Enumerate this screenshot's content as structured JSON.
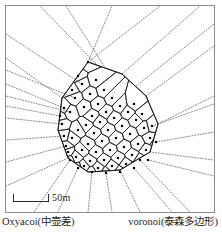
{
  "figure": {
    "scale_bar": {
      "label": "50m",
      "length_m": 50
    },
    "captions": {
      "left": "Oxyacoi(中壶差)",
      "right": "voronoi(泰森多边形)"
    },
    "colors": {
      "frame": "#8d8d8d",
      "cell_edge": "#1a1a1a",
      "ray": "#555555",
      "seed": "#000000",
      "background": "#ffffff"
    }
  },
  "chart_data": {
    "type": "scatter",
    "title": "",
    "subtitle": "",
    "xlabel": "",
    "ylabel": "",
    "grid": false,
    "legend_position": "none",
    "annotations": [
      "50m",
      "Oxyacoi(中壶差)",
      "voronoi(泰森多边形)"
    ],
    "xlim": [
      0,
      222
    ],
    "ylim": [
      0,
      232
    ],
    "point_count": 64,
    "hull": [
      [
        88,
        62
      ],
      [
        122,
        74
      ],
      [
        146,
        96
      ],
      [
        158,
        124
      ],
      [
        150,
        152
      ],
      [
        120,
        170
      ],
      [
        88,
        172
      ],
      [
        68,
        158
      ],
      [
        58,
        130
      ],
      [
        62,
        98
      ]
    ],
    "points": [
      [
        88,
        62
      ],
      [
        96,
        80
      ],
      [
        82,
        84
      ],
      [
        104,
        90
      ],
      [
        90,
        94
      ],
      [
        75,
        98
      ],
      [
        112,
        98
      ],
      [
        98,
        104
      ],
      [
        84,
        107
      ],
      [
        120,
        106
      ],
      [
        106,
        112
      ],
      [
        92,
        116
      ],
      [
        70,
        112
      ],
      [
        128,
        112
      ],
      [
        114,
        118
      ],
      [
        100,
        122
      ],
      [
        86,
        125
      ],
      [
        136,
        120
      ],
      [
        122,
        126
      ],
      [
        108,
        130
      ],
      [
        94,
        133
      ],
      [
        78,
        130
      ],
      [
        144,
        128
      ],
      [
        130,
        134
      ],
      [
        116,
        138
      ],
      [
        102,
        141
      ],
      [
        88,
        144
      ],
      [
        72,
        138
      ],
      [
        150,
        138
      ],
      [
        138,
        144
      ],
      [
        124,
        147
      ],
      [
        110,
        150
      ],
      [
        96,
        152
      ],
      [
        82,
        150
      ],
      [
        66,
        146
      ],
      [
        146,
        150
      ],
      [
        132,
        155
      ],
      [
        118,
        158
      ],
      [
        104,
        160
      ],
      [
        90,
        161
      ],
      [
        76,
        157
      ],
      [
        140,
        160
      ],
      [
        126,
        164
      ],
      [
        112,
        166
      ],
      [
        98,
        168
      ],
      [
        84,
        166
      ],
      [
        68,
        152
      ],
      [
        62,
        124
      ],
      [
        64,
        108
      ],
      [
        72,
        90
      ],
      [
        134,
        104
      ],
      [
        142,
        114
      ],
      [
        152,
        126
      ],
      [
        156,
        142
      ],
      [
        148,
        160
      ],
      [
        134,
        168
      ],
      [
        120,
        172
      ],
      [
        106,
        173
      ],
      [
        92,
        172
      ],
      [
        78,
        168
      ],
      [
        70,
        160
      ],
      [
        64,
        136
      ],
      [
        60,
        116
      ],
      [
        78,
        76
      ]
    ],
    "rays": [
      [
        88,
        62,
        160,
        6
      ],
      [
        88,
        62,
        112,
        6
      ],
      [
        82,
        84,
        6,
        34
      ],
      [
        75,
        98,
        6,
        70
      ],
      [
        70,
        112,
        6,
        96
      ],
      [
        62,
        98,
        6,
        58
      ],
      [
        64,
        108,
        6,
        84
      ],
      [
        62,
        124,
        6,
        118
      ],
      [
        60,
        116,
        6,
        106
      ],
      [
        64,
        136,
        6,
        140
      ],
      [
        66,
        146,
        6,
        162
      ],
      [
        68,
        158,
        6,
        186
      ],
      [
        146,
        96,
        214,
        46
      ],
      [
        152,
        126,
        214,
        104
      ],
      [
        156,
        142,
        214,
        132
      ],
      [
        158,
        124,
        214,
        96
      ],
      [
        150,
        152,
        214,
        160
      ],
      [
        148,
        160,
        214,
        176
      ],
      [
        140,
        160,
        190,
        212
      ],
      [
        134,
        168,
        172,
        212
      ],
      [
        120,
        170,
        140,
        212
      ],
      [
        106,
        173,
        112,
        212
      ],
      [
        92,
        172,
        88,
        212
      ],
      [
        78,
        168,
        58,
        212
      ],
      [
        70,
        160,
        34,
        212
      ],
      [
        122,
        74,
        200,
        6
      ],
      [
        104,
        66,
        66,
        6
      ],
      [
        136,
        86,
        214,
        24
      ],
      [
        96,
        64,
        40,
        6
      ]
    ]
  }
}
